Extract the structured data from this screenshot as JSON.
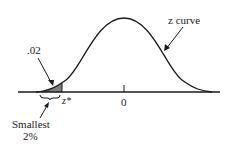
{
  "diagram": {
    "curve_label": "z curve",
    "area_label": ".02",
    "critical_label": "z*",
    "center_tick_label": "0",
    "bracket_label_line1": "Smallest",
    "bracket_label_line2": "2%"
  },
  "colors": {
    "line": "#1a1a1a",
    "shaded_area": "#808080",
    "background": "#ffffff"
  }
}
